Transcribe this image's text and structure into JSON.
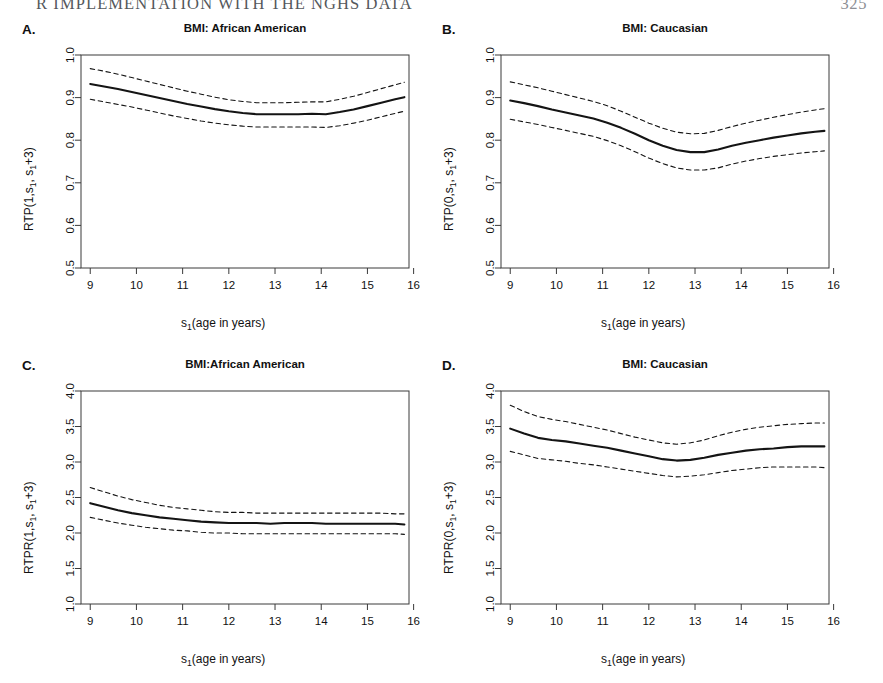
{
  "running_head": {
    "title": "R IMPLEMENTATION WITH THE NGHS DATA",
    "page": "325"
  },
  "figure": {
    "panels": [
      {
        "id": "A",
        "letter": "A.",
        "title": "BMI: African American",
        "ylabel_prefix": "RTP(1,s",
        "ylabel_mid": ", s",
        "ylabel_suffix": "+3)",
        "xlabel_prefix": "s",
        "xlabel_suffix": "(age in years)",
        "ylabel_full": "RTP(1,s1, s1+3)",
        "xlabel_full": "s1(age in years)",
        "ytick_labels": [
          "1.0",
          "0.9",
          "0.8",
          "0.7",
          "0.6",
          "0.5"
        ],
        "ytick_values": [
          1.0,
          0.9,
          0.8,
          0.7,
          0.6,
          0.5
        ],
        "xtick_labels": [
          "9",
          "10",
          "11",
          "12",
          "13",
          "14",
          "15",
          "16"
        ],
        "xtick_values": [
          9,
          10,
          11,
          12,
          13,
          14,
          15,
          16
        ]
      },
      {
        "id": "B",
        "letter": "B.",
        "title": "BMI: Caucasian",
        "ylabel_prefix": "RTP(0,s",
        "ylabel_mid": ", s",
        "ylabel_suffix": "+3)",
        "xlabel_prefix": "s",
        "xlabel_suffix": "(age in years)",
        "ylabel_full": "RTP(0,s1, s1+3)",
        "xlabel_full": "s1(age in years)",
        "ytick_labels": [
          "1.0",
          "0.9",
          "0.8",
          "0.7",
          "0.6",
          "0.5"
        ],
        "ytick_values": [
          1.0,
          0.9,
          0.8,
          0.7,
          0.6,
          0.5
        ],
        "xtick_labels": [
          "9",
          "10",
          "11",
          "12",
          "13",
          "14",
          "15",
          "16"
        ],
        "xtick_values": [
          9,
          10,
          11,
          12,
          13,
          14,
          15,
          16
        ]
      },
      {
        "id": "C",
        "letter": "C.",
        "title": "BMI:African American",
        "ylabel_prefix": "RTPR(1,s",
        "ylabel_mid": ", s",
        "ylabel_suffix": "+3)",
        "xlabel_prefix": "s",
        "xlabel_suffix": "(age in years)",
        "ylabel_full": "RTPR(1,s1, s1+3)",
        "xlabel_full": "s1(age in years)",
        "ytick_labels": [
          "4.0",
          "3.5",
          "3.0",
          "2.5",
          "2.0",
          "1.5",
          "1.0"
        ],
        "ytick_values": [
          4.0,
          3.5,
          3.0,
          2.5,
          2.0,
          1.5,
          1.0
        ],
        "xtick_labels": [
          "9",
          "10",
          "11",
          "12",
          "13",
          "14",
          "15",
          "16"
        ],
        "xtick_values": [
          9,
          10,
          11,
          12,
          13,
          14,
          15,
          16
        ]
      },
      {
        "id": "D",
        "letter": "D.",
        "title": "BMI: Caucasian",
        "ylabel_prefix": "RTPR(0,s",
        "ylabel_mid": ", s",
        "ylabel_suffix": "+3)",
        "xlabel_prefix": "s",
        "xlabel_suffix": "(age in years)",
        "ylabel_full": "RTPR(0,s1, s1+3)",
        "xlabel_full": "s1(age in years)",
        "ytick_labels": [
          "4.0",
          "3.5",
          "3.0",
          "2.5",
          "2.0",
          "1.5",
          "1.0"
        ],
        "ytick_values": [
          4.0,
          3.5,
          3.0,
          2.5,
          2.0,
          1.5,
          1.0
        ],
        "xtick_labels": [
          "9",
          "10",
          "11",
          "12",
          "13",
          "14",
          "15",
          "16"
        ],
        "xtick_values": [
          9,
          10,
          11,
          12,
          13,
          14,
          15,
          16
        ]
      }
    ]
  },
  "chart_data": [
    {
      "panel": "A",
      "type": "line",
      "title": "BMI: African American",
      "xlabel": "s1(age in years)",
      "ylabel": "RTP(1,s1, s1+3)",
      "xlim": [
        8.8,
        15.9
      ],
      "ylim": [
        0.5,
        1.0
      ],
      "grid": false,
      "legend": "none",
      "series": [
        {
          "name": "estimate",
          "style": "solid",
          "x": [
            9.0,
            9.3,
            9.6,
            9.9,
            10.2,
            10.5,
            10.8,
            11.1,
            11.4,
            11.7,
            12.0,
            12.3,
            12.6,
            12.9,
            13.2,
            13.5,
            13.8,
            14.1,
            14.4,
            14.7,
            15.0,
            15.3,
            15.6,
            15.8
          ],
          "y": [
            0.932,
            0.926,
            0.92,
            0.913,
            0.906,
            0.899,
            0.892,
            0.885,
            0.879,
            0.873,
            0.868,
            0.864,
            0.861,
            0.861,
            0.861,
            0.861,
            0.862,
            0.861,
            0.866,
            0.872,
            0.88,
            0.888,
            0.896,
            0.901
          ]
        },
        {
          "name": "upper confidence bound",
          "style": "dashed",
          "x": [
            9.0,
            9.3,
            9.6,
            9.9,
            10.2,
            10.5,
            10.8,
            11.1,
            11.4,
            11.7,
            12.0,
            12.3,
            12.6,
            12.9,
            13.2,
            13.5,
            13.8,
            14.1,
            14.4,
            14.7,
            15.0,
            15.3,
            15.6,
            15.8
          ],
          "y": [
            0.968,
            0.962,
            0.955,
            0.947,
            0.939,
            0.931,
            0.923,
            0.915,
            0.908,
            0.901,
            0.895,
            0.891,
            0.888,
            0.888,
            0.888,
            0.889,
            0.89,
            0.89,
            0.896,
            0.903,
            0.912,
            0.921,
            0.93,
            0.936
          ]
        },
        {
          "name": "lower confidence bound",
          "style": "dashed",
          "x": [
            9.0,
            9.3,
            9.6,
            9.9,
            10.2,
            10.5,
            10.8,
            11.1,
            11.4,
            11.7,
            12.0,
            12.3,
            12.6,
            12.9,
            13.2,
            13.5,
            13.8,
            14.1,
            14.4,
            14.7,
            15.0,
            15.3,
            15.6,
            15.8
          ],
          "y": [
            0.896,
            0.89,
            0.884,
            0.878,
            0.871,
            0.864,
            0.857,
            0.851,
            0.845,
            0.84,
            0.836,
            0.833,
            0.831,
            0.831,
            0.831,
            0.831,
            0.831,
            0.83,
            0.834,
            0.84,
            0.847,
            0.855,
            0.863,
            0.868
          ]
        }
      ]
    },
    {
      "panel": "B",
      "type": "line",
      "title": "BMI: Caucasian",
      "xlabel": "s1(age in years)",
      "ylabel": "RTP(0,s1, s1+3)",
      "xlim": [
        8.8,
        15.9
      ],
      "ylim": [
        0.5,
        1.0
      ],
      "grid": false,
      "legend": "none",
      "series": [
        {
          "name": "estimate",
          "style": "solid",
          "x": [
            9.0,
            9.3,
            9.6,
            9.9,
            10.2,
            10.5,
            10.8,
            11.1,
            11.4,
            11.7,
            12.0,
            12.3,
            12.6,
            12.9,
            13.2,
            13.5,
            13.8,
            14.1,
            14.4,
            14.7,
            15.0,
            15.3,
            15.6,
            15.8
          ],
          "y": [
            0.893,
            0.887,
            0.88,
            0.872,
            0.865,
            0.858,
            0.851,
            0.841,
            0.829,
            0.815,
            0.8,
            0.787,
            0.777,
            0.772,
            0.772,
            0.778,
            0.787,
            0.794,
            0.8,
            0.806,
            0.811,
            0.816,
            0.82,
            0.822
          ]
        },
        {
          "name": "upper confidence bound",
          "style": "dashed",
          "x": [
            9.0,
            9.3,
            9.6,
            9.9,
            10.2,
            10.5,
            10.8,
            11.1,
            11.4,
            11.7,
            12.0,
            12.3,
            12.6,
            12.9,
            13.2,
            13.5,
            13.8,
            14.1,
            14.4,
            14.7,
            15.0,
            15.3,
            15.6,
            15.8
          ],
          "y": [
            0.937,
            0.93,
            0.923,
            0.915,
            0.907,
            0.899,
            0.891,
            0.881,
            0.868,
            0.854,
            0.84,
            0.828,
            0.819,
            0.815,
            0.816,
            0.823,
            0.832,
            0.84,
            0.847,
            0.854,
            0.86,
            0.866,
            0.871,
            0.874
          ]
        },
        {
          "name": "lower confidence bound",
          "style": "dashed",
          "x": [
            9.0,
            9.3,
            9.6,
            9.9,
            10.2,
            10.5,
            10.8,
            11.1,
            11.4,
            11.7,
            12.0,
            12.3,
            12.6,
            12.9,
            13.2,
            13.5,
            13.8,
            14.1,
            14.4,
            14.7,
            15.0,
            15.3,
            15.6,
            15.8
          ],
          "y": [
            0.849,
            0.843,
            0.837,
            0.83,
            0.823,
            0.816,
            0.809,
            0.799,
            0.787,
            0.773,
            0.758,
            0.745,
            0.735,
            0.73,
            0.73,
            0.735,
            0.744,
            0.751,
            0.757,
            0.762,
            0.766,
            0.77,
            0.773,
            0.775
          ]
        }
      ]
    },
    {
      "panel": "C",
      "type": "line",
      "title": "BMI:African American",
      "xlabel": "s1(age in years)",
      "ylabel": "RTPR(1,s1, s1+3)",
      "xlim": [
        8.8,
        15.9
      ],
      "ylim": [
        1.0,
        4.0
      ],
      "grid": false,
      "legend": "none",
      "series": [
        {
          "name": "estimate",
          "style": "solid",
          "x": [
            9.0,
            9.3,
            9.6,
            9.9,
            10.2,
            10.5,
            10.8,
            11.1,
            11.4,
            11.7,
            12.0,
            12.3,
            12.6,
            12.9,
            13.2,
            13.5,
            13.8,
            14.1,
            14.4,
            14.7,
            15.0,
            15.3,
            15.6,
            15.8
          ],
          "y": [
            2.42,
            2.37,
            2.32,
            2.28,
            2.25,
            2.22,
            2.2,
            2.18,
            2.16,
            2.15,
            2.14,
            2.14,
            2.14,
            2.13,
            2.14,
            2.14,
            2.14,
            2.13,
            2.13,
            2.13,
            2.13,
            2.13,
            2.13,
            2.12
          ]
        },
        {
          "name": "upper confidence bound",
          "style": "dashed",
          "x": [
            9.0,
            9.3,
            9.6,
            9.9,
            10.2,
            10.5,
            10.8,
            11.1,
            11.4,
            11.7,
            12.0,
            12.3,
            12.6,
            12.9,
            13.2,
            13.5,
            13.8,
            14.1,
            14.4,
            14.7,
            15.0,
            15.3,
            15.6,
            15.8
          ],
          "y": [
            2.64,
            2.58,
            2.52,
            2.47,
            2.43,
            2.39,
            2.36,
            2.34,
            2.32,
            2.3,
            2.29,
            2.29,
            2.28,
            2.28,
            2.28,
            2.28,
            2.28,
            2.28,
            2.28,
            2.28,
            2.28,
            2.28,
            2.27,
            2.27
          ]
        },
        {
          "name": "lower confidence bound",
          "style": "dashed",
          "x": [
            9.0,
            9.3,
            9.6,
            9.9,
            10.2,
            10.5,
            10.8,
            11.1,
            11.4,
            11.7,
            12.0,
            12.3,
            12.6,
            12.9,
            13.2,
            13.5,
            13.8,
            14.1,
            14.4,
            14.7,
            15.0,
            15.3,
            15.6,
            15.8
          ],
          "y": [
            2.22,
            2.18,
            2.14,
            2.11,
            2.08,
            2.06,
            2.04,
            2.03,
            2.01,
            2.0,
            2.0,
            1.99,
            1.99,
            1.99,
            1.99,
            1.99,
            1.99,
            1.99,
            1.99,
            1.99,
            1.99,
            1.99,
            1.99,
            1.98
          ]
        }
      ]
    },
    {
      "panel": "D",
      "type": "line",
      "title": "BMI: Caucasian",
      "xlabel": "s1(age in years)",
      "ylabel": "RTPR(0,s1, s1+3)",
      "xlim": [
        8.8,
        15.9
      ],
      "ylim": [
        1.0,
        4.0
      ],
      "grid": false,
      "legend": "none",
      "series": [
        {
          "name": "estimate",
          "style": "solid",
          "x": [
            9.0,
            9.3,
            9.6,
            9.9,
            10.2,
            10.5,
            10.8,
            11.1,
            11.4,
            11.7,
            12.0,
            12.3,
            12.6,
            12.9,
            13.2,
            13.5,
            13.8,
            14.1,
            14.4,
            14.7,
            15.0,
            15.3,
            15.6,
            15.8
          ],
          "y": [
            3.47,
            3.4,
            3.34,
            3.31,
            3.29,
            3.26,
            3.23,
            3.2,
            3.16,
            3.12,
            3.08,
            3.04,
            3.02,
            3.03,
            3.06,
            3.1,
            3.13,
            3.16,
            3.18,
            3.19,
            3.21,
            3.22,
            3.22,
            3.22
          ]
        },
        {
          "name": "upper confidence bound",
          "style": "dashed",
          "x": [
            9.0,
            9.3,
            9.6,
            9.9,
            10.2,
            10.5,
            10.8,
            11.1,
            11.4,
            11.7,
            12.0,
            12.3,
            12.6,
            12.9,
            13.2,
            13.5,
            13.8,
            14.1,
            14.4,
            14.7,
            15.0,
            15.3,
            15.6,
            15.8
          ],
          "y": [
            3.8,
            3.71,
            3.64,
            3.6,
            3.57,
            3.53,
            3.49,
            3.45,
            3.4,
            3.35,
            3.31,
            3.27,
            3.25,
            3.27,
            3.31,
            3.37,
            3.42,
            3.46,
            3.49,
            3.51,
            3.53,
            3.54,
            3.55,
            3.55
          ]
        },
        {
          "name": "lower confidence bound",
          "style": "dashed",
          "x": [
            9.0,
            9.3,
            9.6,
            9.9,
            10.2,
            10.5,
            10.8,
            11.1,
            11.4,
            11.7,
            12.0,
            12.3,
            12.6,
            12.9,
            13.2,
            13.5,
            13.8,
            14.1,
            14.4,
            14.7,
            15.0,
            15.3,
            15.6,
            15.8
          ],
          "y": [
            3.15,
            3.1,
            3.05,
            3.03,
            3.01,
            2.98,
            2.96,
            2.93,
            2.9,
            2.87,
            2.84,
            2.81,
            2.79,
            2.8,
            2.82,
            2.85,
            2.88,
            2.9,
            2.92,
            2.93,
            2.93,
            2.93,
            2.93,
            2.92
          ]
        }
      ]
    }
  ],
  "style": {
    "line_color": "#141414",
    "axis_color": "#3a3a3a",
    "background": "#ffffff"
  }
}
